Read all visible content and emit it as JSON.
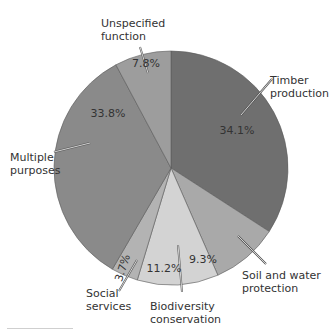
{
  "chart_data": {
    "type": "pie",
    "title": "",
    "start_angle": "12 o'clock",
    "direction": "clockwise",
    "categories": [
      "Timber production",
      "Soil and water protection",
      "Biodiversity conservation",
      "Social services",
      "Multiple purposes",
      "Unspecified function"
    ],
    "values": [
      34.1,
      9.3,
      11.2,
      3.7,
      33.8,
      7.8
    ],
    "value_labels": [
      "34.1%",
      "9.3%",
      "11.2%",
      "3.7%",
      "33.8%",
      "7.8%"
    ],
    "colors": [
      "#6f6f6f",
      "#a9a9a9",
      "#d3d3d3",
      "#b3b3b3",
      "#8a8a8a",
      "#9d9d9d"
    ],
    "label_lines": [
      [
        "Timber",
        "production"
      ],
      [
        "Soil and water",
        "protection"
      ],
      [
        "Biodiversity",
        "conservation"
      ],
      [
        "Social",
        "services"
      ],
      [
        "Multiple",
        "purposes"
      ],
      [
        "Unspecified",
        "function"
      ]
    ],
    "legend": "none (callout labels)"
  }
}
